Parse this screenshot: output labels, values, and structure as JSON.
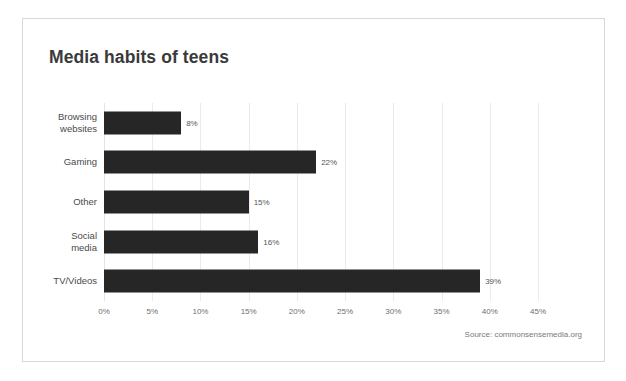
{
  "card": {
    "title": "Media habits of teens",
    "source": "Source: commonsensemedia.org"
  },
  "chart_data": {
    "type": "bar",
    "orientation": "horizontal",
    "title": "Media habits of teens",
    "xlabel": "",
    "ylabel": "",
    "categories": [
      "Browsing\nwebsites",
      "Gaming",
      "Other",
      "Social\nmedia",
      "TV/Videos"
    ],
    "values": [
      8,
      22,
      15,
      16,
      39
    ],
    "value_labels": [
      "8%",
      "22%",
      "15%",
      "16%",
      "39%"
    ],
    "xlim": [
      0,
      45
    ],
    "xticks": [
      0,
      5,
      10,
      15,
      20,
      25,
      30,
      35,
      40,
      45
    ],
    "xtick_labels": [
      "0%",
      "5%",
      "10%",
      "15%",
      "20%",
      "25%",
      "30%",
      "35%",
      "40%",
      "45%"
    ],
    "grid": "vertical",
    "legend": "none",
    "bar_color": "#262626",
    "grid_color": "#ebebeb",
    "label_color": "#4a4a4a",
    "background": "#ffffff"
  }
}
